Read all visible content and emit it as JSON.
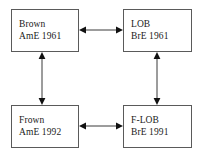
{
  "diagram": {
    "colors": {
      "background": "#ffffff",
      "box_border": "#5a5a5a",
      "text": "#1a1a1a",
      "arrow": "#3a3a3a",
      "arrow_head": "#111111"
    },
    "boxes": [
      {
        "id": "brown",
        "position": "top-left",
        "name": "Brown",
        "meta": "AmE 1961",
        "variety": "AmE",
        "year": 1961
      },
      {
        "id": "lob",
        "position": "top-right",
        "name": "LOB",
        "meta": "BrE 1961",
        "variety": "BrE",
        "year": 1961
      },
      {
        "id": "frown",
        "position": "bottom-left",
        "name": "Frown",
        "meta": "AmE 1992",
        "variety": "AmE",
        "year": 1992
      },
      {
        "id": "flob",
        "position": "bottom-right",
        "name": "F-LOB",
        "meta": "BrE 1991",
        "variety": "BrE",
        "year": 1991
      }
    ],
    "arrows": [
      {
        "id": "brown-lob",
        "orientation": "horizontal",
        "style": "double-headed",
        "from": "brown",
        "to": "lob",
        "icon": "double-arrow-horizontal-icon"
      },
      {
        "id": "frown-flob",
        "orientation": "horizontal",
        "style": "double-headed",
        "from": "frown",
        "to": "flob",
        "icon": "double-arrow-horizontal-icon"
      },
      {
        "id": "brown-frown",
        "orientation": "vertical",
        "style": "double-headed",
        "from": "brown",
        "to": "frown",
        "icon": "double-arrow-vertical-icon"
      },
      {
        "id": "lob-flob",
        "orientation": "vertical",
        "style": "double-headed",
        "from": "lob",
        "to": "flob",
        "icon": "double-arrow-vertical-icon"
      }
    ]
  }
}
